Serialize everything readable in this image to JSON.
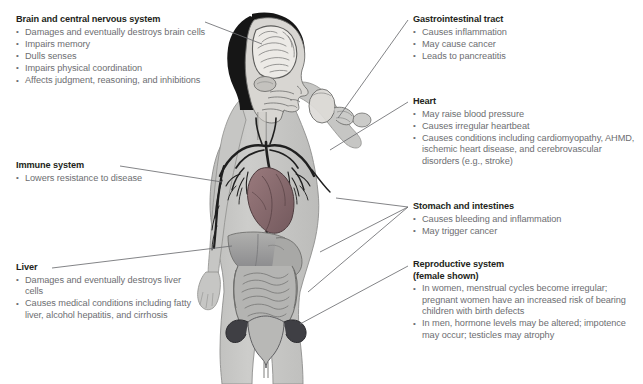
{
  "figure": {
    "subject_description": "Cutaway illustration of a female human body drinking from a glass, showing brain, heart, blood vessels, liver, stomach, intestines and reproductive organs",
    "colors": {
      "background": "#ffffff",
      "body_silhouette": "#c9c9c7",
      "body_outline": "#8a8a88",
      "organ_gray": "#9a9a98",
      "organ_dark": "#55555a",
      "heart": "#8c6f72",
      "vessel_dark": "#2b2b2b",
      "hair_dark": "#1a1a1a",
      "brain_light": "#e6e4e0",
      "heading_text": "#231f20",
      "body_text": "#6d6e71",
      "leader_line": "#6d6e71"
    }
  },
  "callouts": {
    "brain": {
      "heading": "Brain and central nervous system",
      "bullets": [
        "Damages and eventually destroys brain cells",
        "Impairs memory",
        "Dulls senses",
        "Impairs physical coordination",
        "Affects judgment, reasoning, and inhibitions"
      ]
    },
    "immune": {
      "heading": "Immune system",
      "bullets": [
        "Lowers resistance to disease"
      ]
    },
    "liver": {
      "heading": "Liver",
      "bullets": [
        "Damages and eventually destroys liver cells",
        "Causes medical conditions including fatty liver, alcohol hepatitis, and cirrhosis"
      ]
    },
    "gastrointestinal": {
      "heading": "Gastrointestinal tract",
      "bullets": [
        "Causes inflammation",
        "May cause cancer",
        "Leads to pancreatitis"
      ]
    },
    "heart": {
      "heading": "Heart",
      "bullets": [
        "May raise blood pressure",
        "Causes irregular heartbeat",
        "Causes conditions including cardiomyopathy, AHMD, ischemic heart disease, and cerebrovascular disorders (e.g., stroke)"
      ]
    },
    "stomach": {
      "heading": "Stomach and intestines",
      "bullets": [
        "Causes bleeding and inflammation",
        "May trigger cancer"
      ]
    },
    "reproductive": {
      "heading": "Reproductive system",
      "subheading": "(female shown)",
      "bullets": [
        "In women, menstrual cycles become irregular; pregnant women have an increased risk of bearing children with birth defects",
        "In men, hormone levels may be altered; impotence may occur; testicles may atrophy"
      ]
    }
  }
}
